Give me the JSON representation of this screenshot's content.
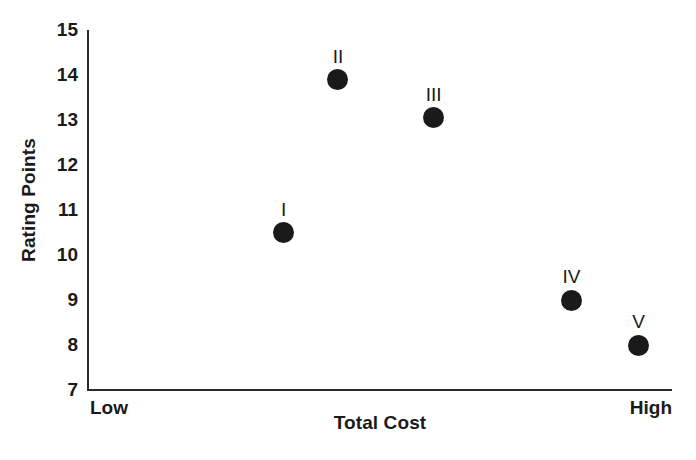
{
  "chart_data": {
    "type": "scatter",
    "title": "",
    "xlabel": "Total Cost",
    "ylabel": "Rating Points",
    "x_axis_type": "categorical-ordinal",
    "x_endpoint_labels": [
      "Low",
      "High"
    ],
    "xlim": [
      0,
      1
    ],
    "ylim": [
      7,
      15
    ],
    "y_ticks": [
      15,
      14,
      13,
      12,
      11,
      10,
      9,
      8,
      7
    ],
    "grid": false,
    "legend": false,
    "marker": {
      "shape": "circle",
      "filled": true,
      "color": "#1a1a1a",
      "size_px": 21
    },
    "points": [
      {
        "label": "I",
        "x": 0.335,
        "y": 10.5
      },
      {
        "label": "II",
        "x": 0.428,
        "y": 13.9
      },
      {
        "label": "III",
        "x": 0.592,
        "y": 13.05
      },
      {
        "label": "IV",
        "x": 0.828,
        "y": 9.0
      },
      {
        "label": "V",
        "x": 0.943,
        "y": 8.0
      }
    ]
  },
  "axes": {
    "y_title": "Rating Points",
    "x_title": "Total Cost",
    "x_low_label": "Low",
    "x_high_label": "High"
  },
  "colors": {
    "axis": "#2b2b2b",
    "marker": "#1a1a1a",
    "text": "#1a1a1a",
    "background": "#ffffff"
  }
}
